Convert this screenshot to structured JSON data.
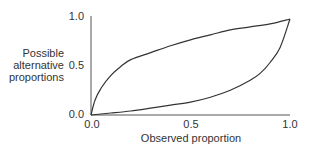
{
  "chart_data": {
    "type": "line",
    "title": "",
    "xlabel": "Observed proportion",
    "ylabel": [
      "Possible",
      "alternative",
      "proportions"
    ],
    "xlim": [
      0,
      1
    ],
    "ylim": [
      0,
      1
    ],
    "grid": false,
    "legend": null,
    "x_ticks": [
      "0.0",
      "0.5",
      "1.0"
    ],
    "y_ticks": [
      "0.0",
      "0.5",
      "1.0"
    ],
    "series": [
      {
        "name": "upper bound",
        "x": [
          0,
          0.02,
          0.05,
          0.1,
          0.15,
          0.2,
          0.3,
          0.4,
          0.5,
          0.6,
          0.7,
          0.8,
          0.9,
          1.0
        ],
        "y": [
          0,
          0.15,
          0.27,
          0.4,
          0.49,
          0.56,
          0.63,
          0.7,
          0.76,
          0.81,
          0.86,
          0.89,
          0.92,
          0.97
        ]
      },
      {
        "name": "lower bound",
        "x": [
          0,
          0.1,
          0.2,
          0.3,
          0.4,
          0.5,
          0.6,
          0.7,
          0.8,
          0.85,
          0.9,
          0.95,
          1.0
        ],
        "y": [
          0,
          0.02,
          0.04,
          0.07,
          0.1,
          0.13,
          0.18,
          0.25,
          0.35,
          0.42,
          0.53,
          0.68,
          0.97
        ]
      }
    ],
    "line_color": "#333333",
    "axis_color": "#555555"
  }
}
